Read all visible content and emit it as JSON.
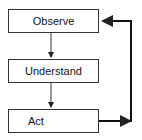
{
  "diagram": {
    "type": "flowchart",
    "nodes": [
      {
        "id": "observe",
        "label": "Observe"
      },
      {
        "id": "understand",
        "label": "Understand"
      },
      {
        "id": "act",
        "label": "Act"
      }
    ],
    "edges": [
      {
        "from": "observe",
        "to": "understand"
      },
      {
        "from": "understand",
        "to": "act"
      },
      {
        "from": "act",
        "to": "observe",
        "style": "feedback-loop"
      }
    ],
    "colors": {
      "stroke": "#333333",
      "loop_stroke": "#111111",
      "background": "#ffffff"
    }
  }
}
